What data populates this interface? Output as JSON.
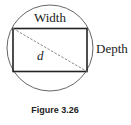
{
  "diagram": {
    "labels": {
      "top": "Width",
      "right": "Depth",
      "diagonal": "d"
    },
    "caption": "Figure 3.26",
    "colors": {
      "stroke": "#333333",
      "circle": "#666666",
      "diagonal": "#888888"
    }
  }
}
